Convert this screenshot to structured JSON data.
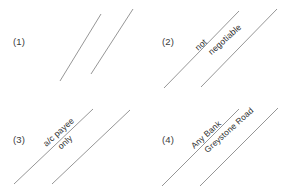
{
  "diagram": {
    "background_color": "#ffffff",
    "line_color": "#8a8a8a",
    "text_color": "#2e2e2e",
    "panels": [
      {
        "label": "(1)",
        "name": "general-crossing",
        "text_lines": []
      },
      {
        "label": "(2)",
        "name": "not-negotiable-crossing",
        "text_lines": [
          "not",
          "negotiable"
        ]
      },
      {
        "label": "(3)",
        "name": "account-payee-crossing",
        "text_lines": [
          "a/c payee",
          "only"
        ]
      },
      {
        "label": "(4)",
        "name": "special-crossing",
        "text_lines": [
          "Any Bank",
          "Greystone Road"
        ]
      }
    ]
  }
}
